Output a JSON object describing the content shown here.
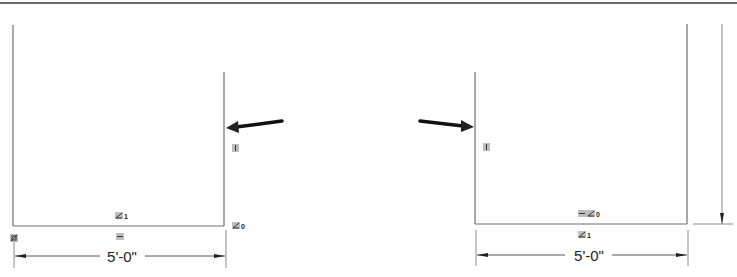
{
  "drawing": {
    "left_view": {
      "dimension_label": "5'-0\"",
      "constraint_glyphs": [
        {
          "id": "parallel-1",
          "icon": "parallel-constraint-icon",
          "subscript": "1"
        },
        {
          "id": "horizontal",
          "icon": "horizontal-constraint-icon",
          "subscript": ""
        },
        {
          "id": "parallel-0",
          "icon": "parallel-constraint-icon",
          "subscript": "0"
        },
        {
          "id": "vertical",
          "icon": "vertical-constraint-icon",
          "subscript": ""
        },
        {
          "id": "fix",
          "icon": "fix-constraint-icon",
          "subscript": ""
        }
      ],
      "callout_arrow": "arrow-pointing-left-icon"
    },
    "right_view": {
      "dimension_label": "5'-0\"",
      "constraint_glyphs": [
        {
          "id": "horizontal-parallel-0",
          "icon": "horizontal-parallel-constraint-icon",
          "subscript": "0"
        },
        {
          "id": "parallel-1",
          "icon": "parallel-constraint-icon",
          "subscript": "1"
        },
        {
          "id": "vertical",
          "icon": "vertical-constraint-icon",
          "subscript": ""
        }
      ],
      "callout_arrow": "arrow-pointing-right-icon"
    }
  }
}
